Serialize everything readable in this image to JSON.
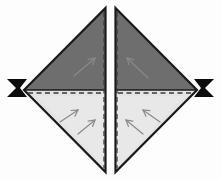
{
  "figure": {
    "title": "Origami fold step diagram",
    "background_color": "#fdfdfd"
  },
  "canvas": {
    "width": 221,
    "height": 179
  },
  "palette": {
    "paper_dark": "#6e6e6e",
    "paper_dark_shade": "#5d5d5d",
    "paper_light": "#e4e4e4",
    "paper_light_shade": "#d6d6d6",
    "outline": "#1a1a1a",
    "fold_dash": "#3a3a3a",
    "arrow": "#8a8a8a",
    "tab_black": "#0d0d0d",
    "background": "#fdfdfd"
  },
  "geometry": {
    "center_x": 110.5,
    "center_y": 90,
    "apex_top_y": 8,
    "apex_bottom_y": 172,
    "left_corner_x": 22,
    "right_corner_x": 199,
    "mid_y": 90,
    "gap_half_width": 5
  },
  "shapes": [
    {
      "id": "left-upper-panel",
      "label": "Left upper triangle (colored side)",
      "fill": "paper_dark",
      "points": "105.5,8 105.5,90 24,90"
    },
    {
      "id": "right-upper-panel",
      "label": "Right upper triangle (colored side)",
      "fill": "paper_dark",
      "points": "115.5,8 197,90 115.5,90"
    },
    {
      "id": "left-lower-panel",
      "label": "Left lower triangle (white side)",
      "fill": "paper_light",
      "points": "105.5,90 105.5,172 24,90"
    },
    {
      "id": "right-lower-panel",
      "label": "Right lower triangle (white side)",
      "fill": "paper_light",
      "points": "115.5,90 197,90 115.5,172"
    }
  ],
  "fold_lines": [
    {
      "id": "fold-center-left",
      "label": "Vertical valley fold, left half",
      "x1": 104,
      "y1": 12,
      "x2": 104,
      "y2": 168,
      "style": "dashed"
    },
    {
      "id": "fold-center-right",
      "label": "Vertical valley fold, right half",
      "x1": 117,
      "y1": 12,
      "x2": 117,
      "y2": 168,
      "style": "dashed"
    },
    {
      "id": "fold-horizontal-left",
      "label": "Horizontal valley fold, left half",
      "x1": 28,
      "y1": 93,
      "x2": 103,
      "y2": 93,
      "style": "dashed"
    },
    {
      "id": "fold-horizontal-right",
      "label": "Horizontal valley fold, right half",
      "x1": 118,
      "y1": 93,
      "x2": 193,
      "y2": 93,
      "style": "dashed"
    }
  ],
  "arrows": [
    {
      "id": "arrow-upper-left",
      "label": "Fold direction arrow, upper left panel",
      "x1": 74,
      "y1": 76,
      "x2": 95,
      "y2": 58,
      "head": "up-right"
    },
    {
      "id": "arrow-upper-right",
      "label": "Fold direction arrow, upper right panel",
      "x1": 148,
      "y1": 78,
      "x2": 127,
      "y2": 58,
      "head": "up-left"
    },
    {
      "id": "arrow-lower-left-a",
      "label": "Fold direction arrow, lower left panel upper",
      "x1": 60,
      "y1": 122,
      "x2": 78,
      "y2": 110,
      "head": "up-right"
    },
    {
      "id": "arrow-lower-left-b",
      "label": "Fold direction arrow, lower left panel lower",
      "x1": 78,
      "y1": 134,
      "x2": 95,
      "y2": 120,
      "head": "up-right"
    },
    {
      "id": "arrow-lower-right-a",
      "label": "Fold direction arrow, lower right panel upper",
      "x1": 160,
      "y1": 122,
      "x2": 143,
      "y2": 110,
      "head": "up-left"
    },
    {
      "id": "arrow-lower-right-b",
      "label": "Fold direction arrow, lower right panel lower",
      "x1": 143,
      "y1": 134,
      "x2": 126,
      "y2": 120,
      "head": "up-left"
    }
  ],
  "tabs": [
    {
      "id": "tab-left",
      "label": "Left layered paper edge tab",
      "points": "7,79 27,79 20,88 27,97 7,97 16,88",
      "fill": "tab_black"
    },
    {
      "id": "tab-right",
      "label": "Right layered paper edge tab",
      "points": "214,79 194,79 201,88 194,97 214,97 205,88",
      "fill": "tab_black"
    }
  ]
}
